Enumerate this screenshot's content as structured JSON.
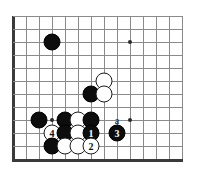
{
  "figure": {
    "kind": "go-board-diagram",
    "title": "",
    "width": 197,
    "height": 182,
    "background": "#ffffff"
  },
  "board": {
    "origin_x": 13,
    "origin_y": 16,
    "spacing": 13,
    "cols": 14,
    "rows": 12,
    "line_color": "#8a8a8a",
    "edge_color": "#3a3a3a",
    "edges": {
      "left": true,
      "top": false,
      "right": false,
      "bottom": true
    },
    "hoshi": [
      {
        "col": 3,
        "row": 8
      },
      {
        "col": 9,
        "row": 2
      },
      {
        "col": 9,
        "row": 8
      }
    ]
  },
  "stones": [
    {
      "col": 3,
      "row": 2,
      "color": "black",
      "label": ""
    },
    {
      "col": 6,
      "row": 6,
      "color": "black",
      "label": ""
    },
    {
      "col": 7,
      "row": 5,
      "color": "white",
      "label": ""
    },
    {
      "col": 7,
      "row": 6,
      "color": "white",
      "label": ""
    },
    {
      "col": 2,
      "row": 8,
      "color": "black",
      "label": ""
    },
    {
      "col": 4,
      "row": 8,
      "color": "black",
      "label": ""
    },
    {
      "col": 5,
      "row": 8,
      "color": "white",
      "label": ""
    },
    {
      "col": 6,
      "row": 8,
      "color": "black",
      "label": ""
    },
    {
      "col": 3,
      "row": 9,
      "color": "white",
      "label": "4"
    },
    {
      "col": 4,
      "row": 9,
      "color": "black",
      "label": ""
    },
    {
      "col": 5,
      "row": 9,
      "color": "white",
      "label": ""
    },
    {
      "col": 6,
      "row": 9,
      "color": "black",
      "label": "1"
    },
    {
      "col": 3,
      "row": 10,
      "color": "black",
      "label": ""
    },
    {
      "col": 4,
      "row": 10,
      "color": "white",
      "label": ""
    },
    {
      "col": 5,
      "row": 10,
      "color": "white",
      "label": ""
    },
    {
      "col": 6,
      "row": 10,
      "color": "white",
      "label": "2"
    },
    {
      "col": 8,
      "row": 9,
      "color": "black",
      "label": "3"
    }
  ],
  "labels": [
    {
      "col": 8,
      "row": 8,
      "text": "a"
    }
  ],
  "colors": {
    "black_stone": "#0d0d0d",
    "white_stone": "#ffffff",
    "stone_outline": "#1a1a1a",
    "grid": "#8a8a8a",
    "board_edge": "#3a3a3a",
    "label_text": "#111111",
    "number_on_black": "#ffffff",
    "number_on_white": "#111111"
  }
}
